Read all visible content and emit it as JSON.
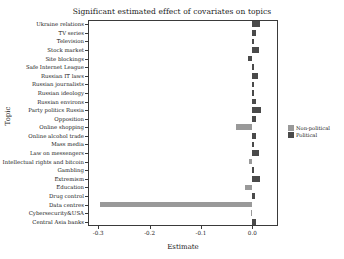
{
  "chart_data": {
    "type": "bar",
    "orientation": "horizontal",
    "title": "Significant estimated effect of covariates on topics",
    "xlabel": "Estimate",
    "ylabel": "Topic",
    "xlim": [
      -0.32,
      0.05
    ],
    "xticks": [
      -0.3,
      -0.2,
      -0.1,
      0.0
    ],
    "xticklabels": [
      "-0.3",
      "-0.2",
      "-0.1",
      "0.0"
    ],
    "grid": false,
    "legend_position": "right",
    "legend": [
      {
        "name": "Non-political",
        "color": "#999999"
      },
      {
        "name": "Political",
        "color": "#4a4a4a"
      }
    ],
    "categories": [
      "Ukraine relations",
      "TV series",
      "Television",
      "Stock market",
      "Site blockings",
      "Safe Internet League",
      "Russian IT laws",
      "Russian journalists",
      "Russian ideology",
      "Russian environs",
      "Party politics Russia",
      "Opposition",
      "Online shopping",
      "Online alcohol trade",
      "Mass media",
      "Law on messengers",
      "Intellectual rights and bitcoin",
      "Gambling",
      "Extremism",
      "Education",
      "Drug control",
      "Data centres",
      "Cybersecurity&USA",
      "Central Asia banks"
    ],
    "values": [
      0.0145,
      0.0072,
      0.0037,
      0.0122,
      -0.0085,
      0.0041,
      0.011,
      0.004,
      0.004,
      0.008,
      0.0177,
      0.0076,
      -0.031,
      0.007,
      0.003,
      0.0125,
      -0.007,
      0.0042,
      0.0142,
      -0.0145,
      0.006,
      -0.297,
      -0.0035,
      0.0065
    ],
    "groups": [
      "Political",
      "Political",
      "Political",
      "Political",
      "Political",
      "Political",
      "Political",
      "Political",
      "Political",
      "Political",
      "Political",
      "Political",
      "Non-political",
      "Political",
      "Political",
      "Political",
      "Non-political",
      "Political",
      "Political",
      "Non-political",
      "Political",
      "Non-political",
      "Non-political",
      "Political"
    ]
  }
}
